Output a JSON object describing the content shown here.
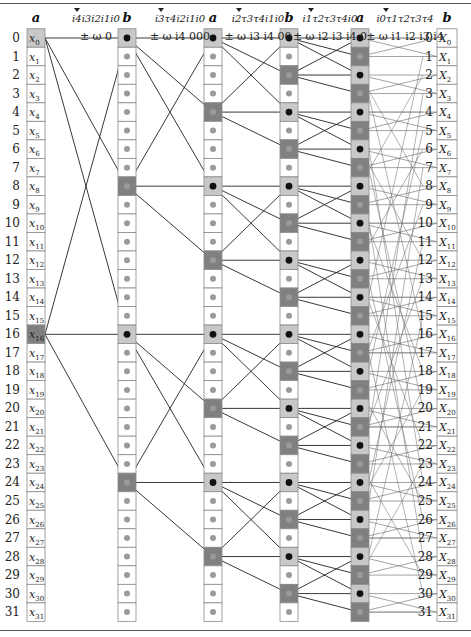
{
  "diagram": {
    "rows": 32,
    "row0_y": 38,
    "row_step": 18.52,
    "cell_h": 18.5,
    "colors": {
      "light": "#c8c8c8",
      "dark": "#808080",
      "white": "#ffffff",
      "border": "#8a8a8a",
      "dot_gray": "#9a9a9a",
      "dot_black": "#111111",
      "line": "#222222",
      "thin_line": "#666666"
    },
    "columns": [
      {
        "header": "a",
        "x": 27,
        "w": 18,
        "kind": "input",
        "light_rows": [
          0
        ],
        "dark_rows": [
          16
        ]
      },
      {
        "header": "b",
        "x": 118,
        "w": 18,
        "kind": "dots",
        "light_rows": [
          0,
          16
        ],
        "dark_rows": [
          8,
          24
        ]
      },
      {
        "header": "a",
        "x": 204,
        "w": 18,
        "kind": "dots",
        "light_rows": [
          0,
          8,
          16,
          24
        ],
        "dark_rows": [
          4,
          12,
          20,
          28
        ]
      },
      {
        "header": "b",
        "x": 280,
        "w": 18,
        "kind": "dots",
        "light_rows": [
          0,
          4,
          8,
          12,
          16,
          20,
          24,
          28
        ],
        "dark_rows": [
          2,
          6,
          10,
          14,
          18,
          22,
          26,
          30
        ]
      },
      {
        "header": "a",
        "x": 351,
        "w": 18,
        "kind": "dots",
        "light_rows": [
          0,
          2,
          4,
          6,
          8,
          10,
          12,
          14,
          16,
          18,
          20,
          22,
          24,
          26,
          28,
          30
        ],
        "dark_rows": [
          1,
          3,
          5,
          7,
          9,
          11,
          13,
          15,
          17,
          19,
          21,
          23,
          25,
          27,
          29,
          31
        ]
      },
      {
        "header": "b",
        "x": 437,
        "w": 20,
        "kind": "output",
        "light_rows": [],
        "dark_rows": []
      }
    ],
    "stage_labels": [
      {
        "bits": "i4 i3 i2 i1 i0",
        "twiddle": "± ω_N^0",
        "x": 96
      },
      {
        "bits": "i3 τ4 i2 i1 i0",
        "twiddle": "± ω_N^{i4 000}",
        "x": 180
      },
      {
        "bits": "i2 τ3 τ4 i1 i0",
        "twiddle": "± ω_N^{i3 i4 00}",
        "x": 258
      },
      {
        "bits": "i1 τ2 τ3 τ4 i0",
        "twiddle": "± ω_N^{i2 i3 i4 0}",
        "x": 330
      },
      {
        "bits": "i0 τ1 τ2 τ3 τ4",
        "twiddle": "± ω_N^{i1 i2 i3 i4}",
        "x": 405
      }
    ],
    "input_labels": [
      "x0",
      "x1",
      "x2",
      "x3",
      "x4",
      "x5",
      "x6",
      "x7",
      "x8",
      "x9",
      "x10",
      "x11",
      "x12",
      "x13",
      "x14",
      "x15",
      "x16",
      "x17",
      "x18",
      "x19",
      "x20",
      "x21",
      "x22",
      "x23",
      "x24",
      "x25",
      "x26",
      "x27",
      "x28",
      "x29",
      "x30",
      "x31"
    ],
    "output_labels": [
      "X0",
      "X1",
      "X2",
      "X3",
      "X4",
      "X5",
      "X6",
      "X7",
      "X8",
      "X9",
      "X10",
      "X11",
      "X12",
      "X13",
      "X14",
      "X15",
      "X16",
      "X17",
      "X18",
      "X19",
      "X20",
      "X21",
      "X22",
      "X23",
      "X24",
      "X25",
      "X26",
      "X27",
      "X28",
      "X29",
      "X30",
      "X31"
    ],
    "row_indices": [
      "0",
      "1",
      "2",
      "3",
      "4",
      "5",
      "6",
      "7",
      "8",
      "9",
      "10",
      "11",
      "12",
      "13",
      "14",
      "15",
      "16",
      "17",
      "18",
      "19",
      "20",
      "21",
      "22",
      "23",
      "24",
      "25",
      "26",
      "27",
      "28",
      "29",
      "30",
      "31"
    ]
  }
}
